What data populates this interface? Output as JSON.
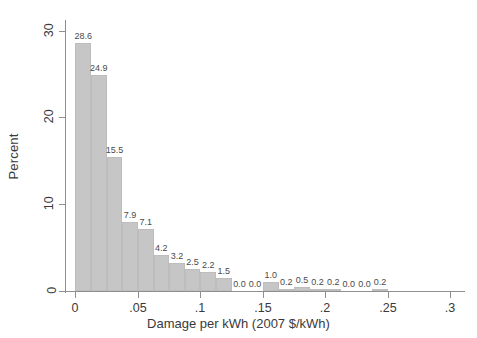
{
  "chart_data": {
    "type": "bar",
    "title": "",
    "xlabel": "Damage per kWh (2007 $/kWh)",
    "ylabel": "Percent",
    "xlim": [
      -0.0075,
      0.3125
    ],
    "ylim": [
      0,
      31
    ],
    "grid": false,
    "legend": null,
    "bin_width": 0.0125,
    "x_tick_labels": [
      "0",
      ".05",
      ".1",
      ".15",
      ".2",
      ".25",
      ".3"
    ],
    "x_tick_values": [
      0,
      0.05,
      0.1,
      0.15,
      0.2,
      0.25,
      0.3
    ],
    "y_tick_labels": [
      "0",
      "10",
      "20",
      "30"
    ],
    "y_tick_values": [
      0,
      10,
      20,
      30
    ],
    "bin_starts": [
      0,
      0.0125,
      0.025,
      0.0375,
      0.05,
      0.0625,
      0.075,
      0.0875,
      0.1,
      0.1125,
      0.125,
      0.1375,
      0.15,
      0.1625,
      0.175,
      0.1875,
      0.2,
      0.2125,
      0.225,
      0.2375
    ],
    "bin_centers": [
      0.00625,
      0.01875,
      0.03125,
      0.04375,
      0.05625,
      0.06875,
      0.08125,
      0.09375,
      0.10625,
      0.11875,
      0.13125,
      0.14375,
      0.15625,
      0.16875,
      0.18125,
      0.19375,
      0.20625,
      0.21875,
      0.23125,
      0.24375
    ],
    "values": [
      28.6,
      24.9,
      15.5,
      7.9,
      7.1,
      4.2,
      3.2,
      2.5,
      2.2,
      1.5,
      0.0,
      0.0,
      1.0,
      0.2,
      0.5,
      0.2,
      0.2,
      0.0,
      0.0,
      0.2
    ],
    "data_labels": [
      "28.6",
      "24.9",
      "15.5",
      "7.9",
      "7.1",
      "4.2",
      "3.2",
      "2.5",
      "2.2",
      "1.5",
      "0.0",
      "0.0",
      "1.0",
      "0.2",
      "0.5",
      "0.2",
      "0.2",
      "0.0",
      "0.0",
      "0.2"
    ],
    "bar_color": "#c6c6c6",
    "axis_color": "#8f8f8f",
    "text_color": "#3a3a3a",
    "background_color": "#ffffff"
  }
}
